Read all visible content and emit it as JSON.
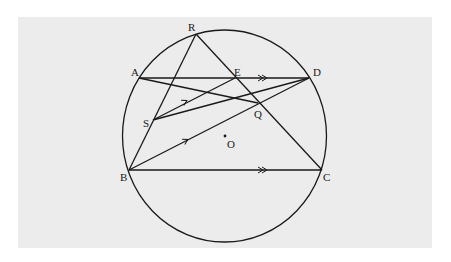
{
  "diagram": {
    "background": {
      "x": 18,
      "y": 17,
      "width": 414,
      "height": 231,
      "color": "#ececec"
    },
    "circle": {
      "name": "O",
      "cx": 224.5,
      "cy": 136,
      "rx": 102,
      "ry": 106
    },
    "points": {
      "R": {
        "x": 196,
        "y": 34,
        "label": "R",
        "lx": 188,
        "ly": 31
      },
      "A": {
        "x": 139,
        "y": 78,
        "label": "A",
        "lx": 131,
        "ly": 76
      },
      "E": {
        "x": 235,
        "y": 78,
        "label": "E",
        "lx": 234,
        "ly": 76
      },
      "D": {
        "x": 309,
        "y": 78,
        "label": "D",
        "lx": 313,
        "ly": 76
      },
      "S": {
        "x": 153,
        "y": 120,
        "label": "S",
        "lx": 143,
        "ly": 127
      },
      "Q": {
        "x": 258,
        "y": 103,
        "label": "Q",
        "lx": 254,
        "ly": 118
      },
      "O": {
        "x": 225,
        "y": 136,
        "label": "O",
        "lx": 227,
        "ly": 148
      },
      "B": {
        "x": 129,
        "y": 170,
        "label": "B",
        "lx": 120,
        "ly": 181
      },
      "C": {
        "x": 322,
        "y": 170,
        "label": "C",
        "lx": 323,
        "ly": 181
      }
    },
    "segments": [
      {
        "from": "R",
        "to": "B"
      },
      {
        "from": "R",
        "to": "C"
      },
      {
        "from": "A",
        "to": "D"
      },
      {
        "from": "A",
        "to": "Q"
      },
      {
        "from": "S",
        "to": "E"
      },
      {
        "from": "S",
        "to": "D"
      },
      {
        "from": "B",
        "to": "D"
      },
      {
        "from": "B",
        "to": "C"
      }
    ],
    "parallel_marks": [
      {
        "segment": "AD",
        "type": "double",
        "x": 263,
        "y": 78
      },
      {
        "segment": "BC",
        "type": "double",
        "x": 263,
        "y": 170
      },
      {
        "segment": "SE",
        "type": "single",
        "x": 186,
        "y": 101
      },
      {
        "segment": "BD",
        "type": "single",
        "x": 187,
        "y": 140
      }
    ]
  }
}
